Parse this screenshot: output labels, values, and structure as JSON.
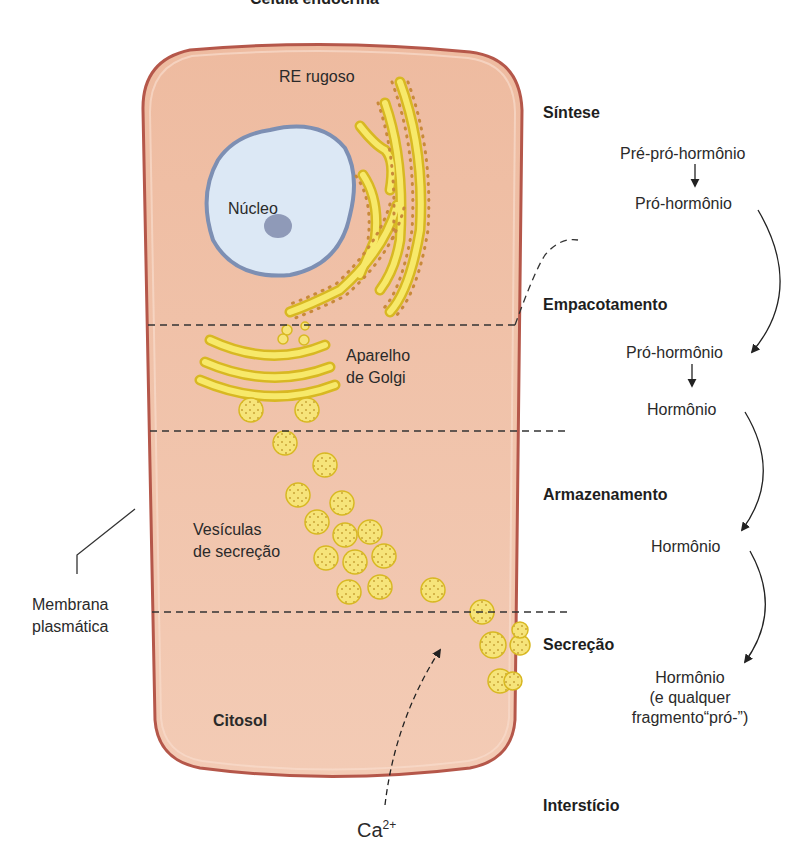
{
  "title": "Célula endócrina",
  "cell": {
    "labels": {
      "rer": "RE rugoso",
      "nucleus": "Núcleo",
      "golgi_line1": "Aparelho",
      "golgi_line2": "de Golgi",
      "vesicles_line1": "Vesículas",
      "vesicles_line2": "de secreção",
      "cytosol": "Citosol",
      "membrane_line1": "Membrana",
      "membrane_line2": "plasmática",
      "calcium_base": "Ca",
      "calcium_superscript": "2+"
    }
  },
  "stages": [
    {
      "name": "Síntese"
    },
    {
      "name": "Empacotamento"
    },
    {
      "name": "Armazenamento"
    },
    {
      "name": "Secreção"
    },
    {
      "name": "Interstício"
    }
  ],
  "pathway": {
    "synthesis_a": "Pré-pró-hormônio",
    "synthesis_b": "Pró-hormônio",
    "packaging_a": "Pró-hormônio",
    "packaging_b": "Hormônio",
    "storage": "Hormônio",
    "secretion_line1": "Hormônio",
    "secretion_line2": "(e qualquer",
    "secretion_line3": "fragmento“pró-”)"
  },
  "colors": {
    "cytoplasm": "#f1c3aa",
    "membrane": "#b5574a",
    "nucleus_fill": "#dce8f5",
    "nucleus_border": "#7d8fb3",
    "nucleolus": "#8f9ab8",
    "organelle_yellow": "#f5e35a",
    "organelle_edge": "#d8b822",
    "ribosome": "#c9893a"
  }
}
